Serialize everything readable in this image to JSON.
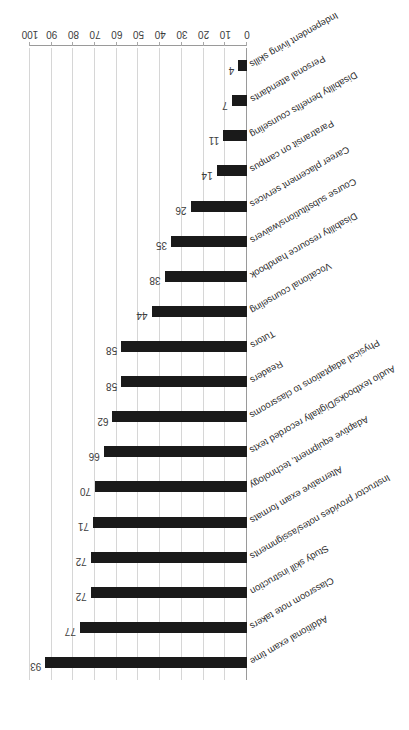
{
  "chart_data": {
    "type": "bar",
    "orientation": "horizontal",
    "title": "",
    "subtitle": "",
    "xlabel": "",
    "ylabel": "",
    "xlim": [
      0,
      100
    ],
    "xticks": [
      "0",
      "10",
      "20",
      "30",
      "40",
      "50",
      "60",
      "70",
      "80",
      "90",
      "100"
    ],
    "grid": true,
    "legend": false,
    "bar_color": "#1a1a1a",
    "gridline_color": "#d6d6d6",
    "axis_color": "#9a9a9a",
    "label_color": "#2b2b2b",
    "data_label_color": "#3c3c3c",
    "rotation_note": "figure is printed upside down (rotated 180 degrees)",
    "categories": [
      "Additional exam time",
      "Classroom note takers",
      "Study skill instruction",
      "Instructor provides notes/assignments",
      "Alternative exam formats",
      "Adaptive equipment, technology",
      "Audio textbooks/Digitally recorded texts",
      "Physical adaptations to classrooms",
      "Readers",
      "Tutors",
      "Vocational counseling",
      "Disability resource handbook",
      "Course substitutions/waivers",
      "Career placement services",
      "Paratransit on campus",
      "Disability benefits counseling",
      "Personal attendants",
      "Independent living skills"
    ],
    "values": [
      93,
      77,
      72,
      72,
      71,
      70,
      66,
      62,
      58,
      58,
      44,
      38,
      35,
      26,
      14,
      11,
      7,
      4
    ],
    "data_labels": [
      "93",
      "77",
      "72",
      "72",
      "71",
      "70",
      "66",
      "62",
      "58",
      "58",
      "44",
      "38",
      "35",
      "26",
      "14",
      "11",
      "7",
      "4"
    ]
  }
}
